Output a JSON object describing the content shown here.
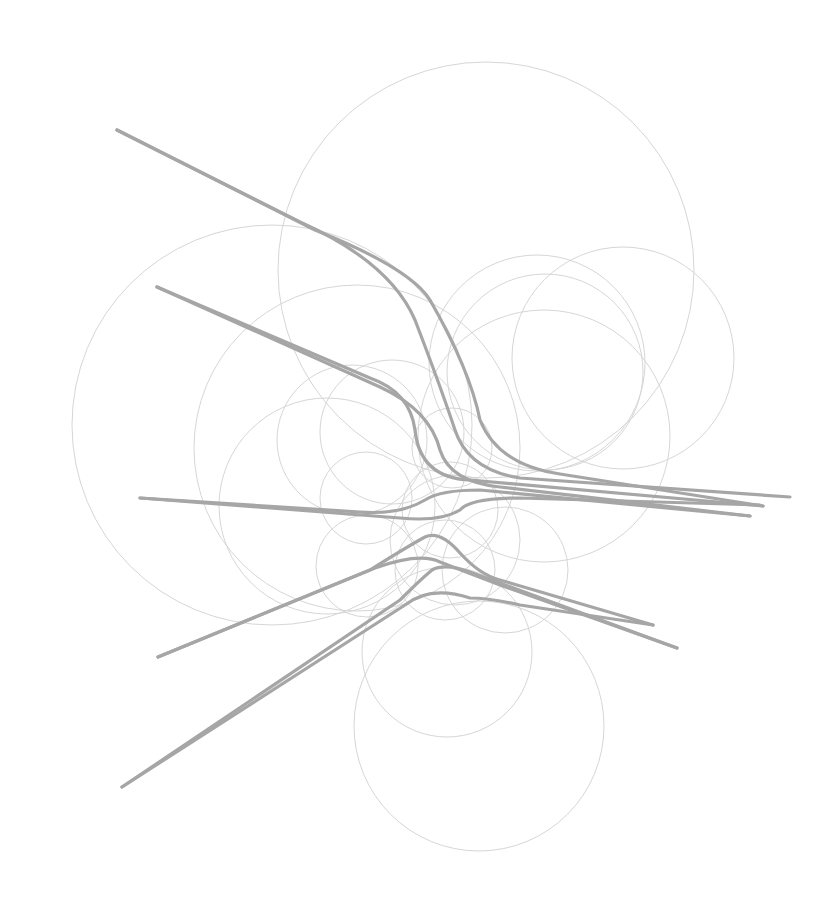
{
  "diagram": {
    "width": 839,
    "height": 914,
    "background": "#ffffff",
    "circle_color": "#d6d6d6",
    "edge_color": "#a6a6a6",
    "circles": [
      {
        "cx": 486,
        "cy": 270,
        "r": 208
      },
      {
        "cx": 272,
        "cy": 425,
        "r": 200
      },
      {
        "cx": 357,
        "cy": 448,
        "r": 163
      },
      {
        "cx": 537,
        "cy": 363,
        "r": 108
      },
      {
        "cx": 545,
        "cy": 372,
        "r": 98
      },
      {
        "cx": 623,
        "cy": 358,
        "r": 111
      },
      {
        "cx": 544,
        "cy": 436,
        "r": 126
      },
      {
        "cx": 352,
        "cy": 440,
        "r": 75
      },
      {
        "cx": 392,
        "cy": 432,
        "r": 72
      },
      {
        "cx": 452,
        "cy": 448,
        "r": 40
      },
      {
        "cx": 327,
        "cy": 506,
        "r": 108
      },
      {
        "cx": 366,
        "cy": 498,
        "r": 46
      },
      {
        "cx": 450,
        "cy": 510,
        "r": 48
      },
      {
        "cx": 455,
        "cy": 540,
        "r": 65
      },
      {
        "cx": 505,
        "cy": 570,
        "r": 63
      },
      {
        "cx": 367,
        "cy": 566,
        "r": 51
      },
      {
        "cx": 447,
        "cy": 652,
        "r": 85
      },
      {
        "cx": 479,
        "cy": 726,
        "r": 125
      },
      {
        "cx": 445,
        "cy": 570,
        "r": 50
      }
    ],
    "edges": [
      {
        "d": "M117,130 L300,222 Q390,262 415,320 Q440,385 455,430 Q468,470 520,478 L790,497"
      },
      {
        "d": "M117,130 L315,230 Q410,268 430,300 Q470,370 480,420 Q498,465 560,474 L763,506"
      },
      {
        "d": "M157,287 L370,378 Q410,392 415,430 Q420,478 470,480 L763,506"
      },
      {
        "d": "M157,287 L380,387 Q430,410 440,450 Q450,482 500,487 L750,516"
      },
      {
        "d": "M140,498 L360,512 Q400,515 425,500 Q440,490 480,490 L750,516"
      },
      {
        "d": "M140,498 L400,518 Q440,522 460,510 Q470,498 520,498 L760,505"
      },
      {
        "d": "M158,657 L370,570 Q410,545 425,537 Q440,530 460,553 Q480,575 500,580 L653,625"
      },
      {
        "d": "M158,657 L375,568 Q420,552 440,562 L500,585 L677,648"
      },
      {
        "d": "M122,787 L400,600 Q420,580 432,570 Q445,563 470,572 L677,648"
      },
      {
        "d": "M122,787 L405,605 Q430,585 470,598 Q490,598 520,605 L653,625"
      }
    ]
  }
}
